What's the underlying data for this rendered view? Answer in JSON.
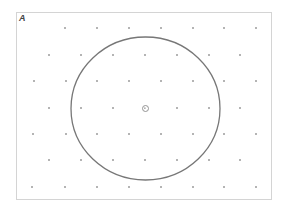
{
  "figure": {
    "panel_label": "A",
    "frame": {
      "x": 16,
      "y": 12,
      "width": 256,
      "height": 188,
      "stroke": "#d4d4d4"
    },
    "circle": {
      "cx": 145.5,
      "cy": 108.5,
      "rx": 74.5,
      "ry": 71.5,
      "stroke": "#777777"
    },
    "center_marker": {
      "cx": 145.5,
      "cy": 108.5,
      "r": 3,
      "stroke": "#888888"
    },
    "dot_color": "#555555",
    "lattice_rows": [
      {
        "y": 28,
        "x": [
          65,
          97,
          129,
          161,
          193,
          224,
          256
        ]
      },
      {
        "y": 55,
        "x": [
          49,
          81,
          113,
          145,
          177,
          209,
          240
        ]
      },
      {
        "y": 81,
        "x": [
          34,
          66,
          97,
          129,
          161,
          193,
          224,
          256
        ]
      },
      {
        "y": 108,
        "x": [
          49,
          81,
          113,
          177,
          209,
          240
        ]
      },
      {
        "y": 134,
        "x": [
          33,
          66,
          97,
          129,
          161,
          193,
          224,
          256
        ]
      },
      {
        "y": 160,
        "x": [
          49,
          81,
          113,
          145,
          177,
          209,
          240
        ]
      },
      {
        "y": 187,
        "x": [
          32,
          65,
          97,
          129,
          161,
          193,
          224,
          256
        ]
      }
    ]
  }
}
